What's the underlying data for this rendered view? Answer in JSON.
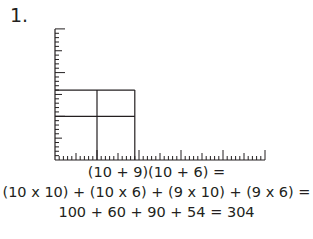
{
  "problem": {
    "number_label": "1.",
    "factors": {
      "a": 10,
      "b": 9,
      "c": 10,
      "d": 6
    },
    "equation_lines": [
      "(10 + 9)(10 + 6) =",
      "(10 x 10) + (10 x 6) + (9 x 10) + (9 x 6) =",
      "100 + 60 + 90 + 54 = 304"
    ],
    "result": 304
  },
  "diagram": {
    "type": "area-model-grid",
    "origin_px": [
      55,
      160
    ],
    "unit_px_x": 4.2,
    "unit_px_y": 4.37,
    "x_axis_units": 50,
    "y_axis_units": 30,
    "rectangle": {
      "width_units": [
        10,
        9
      ],
      "height_units": [
        10,
        6
      ]
    },
    "line_color": "#231f20"
  }
}
